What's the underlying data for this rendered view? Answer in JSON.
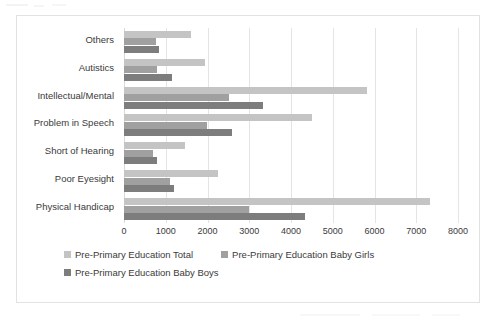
{
  "chart_data": {
    "type": "bar",
    "orientation": "horizontal",
    "title": "",
    "subtitle": "",
    "xlabel": "",
    "ylabel": "",
    "xlim": [
      0,
      8000
    ],
    "xticks": [
      "0",
      "1000",
      "2000",
      "3000",
      "4000",
      "5000",
      "6000",
      "7000",
      "8000"
    ],
    "xtick_values": [
      0,
      1000,
      2000,
      3000,
      4000,
      5000,
      6000,
      7000,
      8000
    ],
    "grid": true,
    "legend_position": "bottom",
    "categories": [
      "Others",
      "Autistics",
      "Intellectual/Mental",
      "Problem in Speech",
      "Short of Hearing",
      "Poor Eyesight",
      "Physical Handicap"
    ],
    "series": [
      {
        "name": "Pre-Primary Education Total",
        "color": "#c4c4c4",
        "values": [
          1600,
          1930,
          5830,
          4510,
          1470,
          2240,
          7330
        ]
      },
      {
        "name": "Pre-Primary Education Baby Girls",
        "color": "#a0a0a0",
        "values": [
          760,
          800,
          2520,
          1990,
          700,
          1110,
          3000
        ]
      },
      {
        "name": "Pre-Primary Education Baby Boys",
        "color": "#7d7d7d",
        "values": [
          840,
          1150,
          3330,
          2580,
          790,
          1200,
          4340
        ]
      }
    ]
  },
  "legend": {
    "items": [
      {
        "label": "Pre-Primary Education Total",
        "color": "#c4c4c4"
      },
      {
        "label": "Pre-Primary Education Baby Girls",
        "color": "#a0a0a0"
      },
      {
        "label": "Pre-Primary Education Baby Boys",
        "color": "#7d7d7d"
      }
    ]
  },
  "colors": {
    "total": "#c4c4c4",
    "girls": "#a0a0a0",
    "boys": "#7d7d7d",
    "grid": "#e4e4e4",
    "border": "#e2e2e2",
    "text": "#3a3a3a",
    "background": "#ffffff"
  }
}
